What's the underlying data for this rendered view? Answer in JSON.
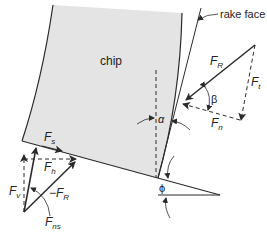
{
  "diagram": {
    "labels": {
      "rake_face": "rake face",
      "chip": "chip",
      "F_R": "F",
      "F_R_sub": "R",
      "F_t": "F",
      "F_t_sub": "t",
      "F_n": "F",
      "F_n_sub": "n",
      "beta": "β",
      "alpha": "α",
      "F_s": "F",
      "F_s_sub": "s",
      "F_h": "F",
      "F_h_sub": "h",
      "F_v": "F",
      "F_v_sub": "v",
      "neg_F_R": "−F",
      "neg_F_R_sub": "R",
      "F_ns": "F",
      "F_ns_sub": "ns",
      "phi": "ϕ"
    },
    "colors": {
      "chip_fill": "#e4e4e4",
      "line": "#2a2a2a",
      "text": "#222222"
    }
  }
}
